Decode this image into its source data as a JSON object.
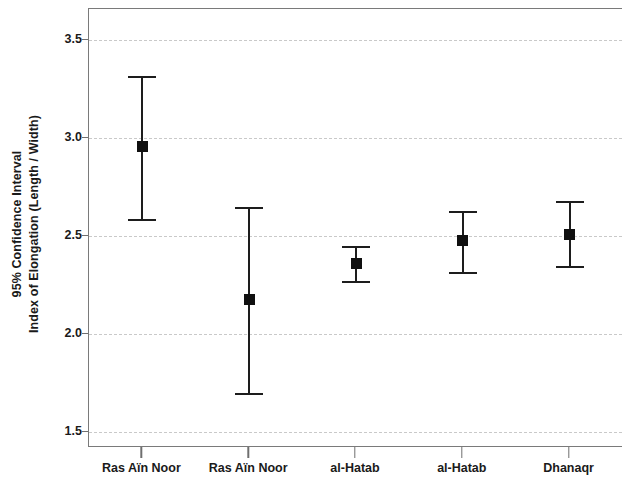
{
  "chart_data": {
    "type": "scatter",
    "title": "",
    "subtitle": "",
    "xlabel": "",
    "ylabel": "95% Confidence Interval Index of Elongation (Length / Width)",
    "ylabel_lines": [
      "95% Confidence Interval",
      "Index of Elongation (Length / Width)"
    ],
    "ylim": [
      1.42,
      3.66
    ],
    "yticks": [
      3.5,
      3.0,
      2.5,
      2.0,
      1.5
    ],
    "ytick_labels": [
      "3.5",
      "3.0",
      "2.5",
      "2.0",
      "1.5"
    ],
    "grid": true,
    "grid_style": "dashed",
    "grid_axis": "y",
    "legend": "none",
    "error_bar_type": "95% confidence interval",
    "categories": [
      "Ras Aïn Noor",
      "Ras Aïn Noor",
      "al-Hatab",
      "al-Hatab",
      "Dhanaqr"
    ],
    "values": [
      2.96,
      2.18,
      2.36,
      2.48,
      2.51
    ],
    "ci_lower": [
      2.59,
      1.7,
      2.27,
      2.32,
      2.35
    ],
    "ci_upper": [
      3.32,
      2.65,
      2.45,
      2.63,
      2.68
    ],
    "points": [
      {
        "label": "Ras Aïn Noor",
        "mean": 2.96,
        "lower": 2.59,
        "upper": 3.32
      },
      {
        "label": "Ras Aïn Noor",
        "mean": 2.18,
        "lower": 1.7,
        "upper": 2.65
      },
      {
        "label": "al-Hatab",
        "mean": 2.36,
        "lower": 2.27,
        "upper": 2.45
      },
      {
        "label": "al-Hatab",
        "mean": 2.48,
        "lower": 2.32,
        "upper": 2.63
      },
      {
        "label": "Dhanaqr",
        "mean": 2.51,
        "lower": 2.35,
        "upper": 2.68
      }
    ],
    "colors": {
      "marker": "#101010",
      "error_line": "#1d1d1d",
      "grid": "#c9c9c9",
      "axis": "#7a7a7a",
      "text": "#1a1a1a",
      "background": "#ffffff"
    }
  }
}
